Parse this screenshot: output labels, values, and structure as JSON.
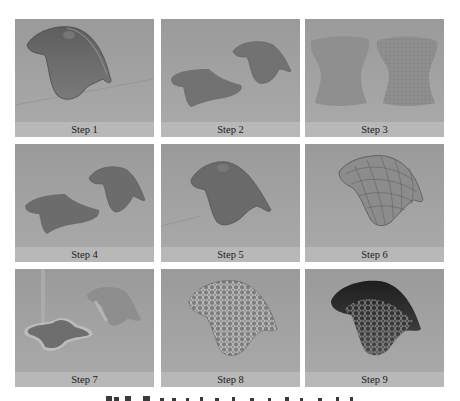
{
  "figure": {
    "panels": [
      {
        "label": "Step 1"
      },
      {
        "label": "Step 2"
      },
      {
        "label": "Step 3"
      },
      {
        "label": "Step 4"
      },
      {
        "label": "Step 5"
      },
      {
        "label": "Step 6"
      },
      {
        "label": "Step 7"
      },
      {
        "label": "Step 8"
      },
      {
        "label": "Step 9"
      }
    ],
    "caption": {
      "text": ""
    },
    "colors": {
      "scene_background": "#9c9c9c",
      "label_band": "#b8b8b8",
      "surface": "#6f6f6f",
      "surface_dark": "#3a3a3a",
      "page": "#ffffff"
    }
  }
}
